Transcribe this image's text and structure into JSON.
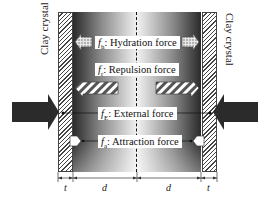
{
  "diagram": {
    "walls": {
      "left_label": "Clay crystal",
      "right_label": "Clay crystal"
    },
    "forces": [
      {
        "symbol": "f",
        "subscript": "h",
        "label": ": Hydration force",
        "pattern": "dotted"
      },
      {
        "symbol": "f",
        "subscript": "r",
        "label": ": Repulsion force",
        "pattern": "hatched"
      },
      {
        "symbol": "f",
        "subscript": "E",
        "label": ": External force",
        "pattern": "solid-dark"
      },
      {
        "symbol": "f",
        "subscript": "a",
        "label": ": Attraction force",
        "pattern": "white"
      }
    ],
    "dimensions": {
      "t_left": "t",
      "d_left": "d",
      "d_right": "d",
      "t_right": "t"
    },
    "colors": {
      "wall_hatch": "#444444",
      "gap_dark": "#2a2a2a",
      "gap_light": "#f2f2f2",
      "external_arrow": "#2b2b2b"
    }
  }
}
